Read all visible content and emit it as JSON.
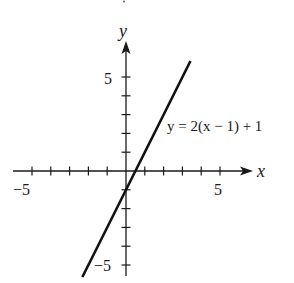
{
  "chart_data": {
    "type": "line",
    "title": "",
    "xlabel": "x",
    "ylabel": "y",
    "xlim": [
      -6,
      6.5
    ],
    "ylim": [
      -6,
      7
    ],
    "grid": false,
    "x_ticks": [
      -5,
      -4,
      -3,
      -2,
      -1,
      1,
      2,
      3,
      4,
      5
    ],
    "y_ticks": [
      -5,
      -4,
      -3,
      -2,
      -1,
      1,
      2,
      3,
      4,
      5
    ],
    "x_tick_labels": {
      "-5": "−5",
      "5": "5"
    },
    "y_tick_labels": {
      "-5": "−5",
      "5": "5"
    },
    "series": [
      {
        "name": "y = 2(x − 1) + 1",
        "equation": "y = 2x - 1",
        "slope": 2,
        "intercept": -1,
        "x": [
          -2.32,
          3.43
        ],
        "y": [
          -5.64,
          5.85
        ],
        "color": "#111111"
      }
    ],
    "annotations": [
      {
        "text": "y = 2(x − 1) + 1",
        "x": 2.2,
        "y": 2.1
      }
    ]
  },
  "labels": {
    "x_axis": "x",
    "y_axis": "y",
    "x_neg5": "−5",
    "x_pos5": "5",
    "y_pos5": "5",
    "y_neg5": "−5",
    "equation": "y = 2(x − 1) + 1"
  },
  "layout": {
    "origin_px": [
      126,
      171
    ],
    "unit_px": 18.8
  }
}
